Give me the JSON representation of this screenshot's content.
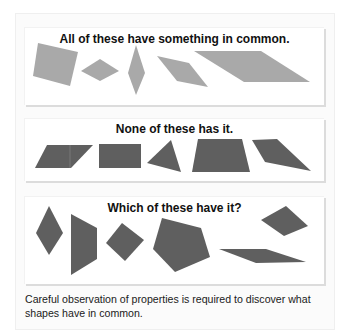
{
  "panels": [
    {
      "title": "All of these have something in common.",
      "fill": "#a9a9a9",
      "shapes": [
        {
          "name": "square",
          "points": "38,43 78,52 70,86 33,76"
        },
        {
          "name": "rhombus",
          "points": "81,71 100,59 119,71 100,81"
        },
        {
          "name": "tall-rhombus",
          "points": "136,45 145,73 136,95 128,73"
        },
        {
          "name": "parallelogram-small",
          "points": "157,56 189,63 208,87 177,81"
        },
        {
          "name": "parallelogram-large",
          "points": "194,51 261,51 310,82 244,82"
        }
      ]
    },
    {
      "title": "None of these has it.",
      "fill": "#5f5f5f",
      "shapes": [
        {
          "name": "parallelogram",
          "points": "47,145 93,145 71,168 35,168"
        },
        {
          "name": "rectangle",
          "points": "99,144 141,144 141,168 99,168"
        },
        {
          "name": "triangle",
          "points": "171,140 181,172 147,163"
        },
        {
          "name": "trapezoid",
          "points": "198,139 242,139 250,172 192,172"
        },
        {
          "name": "quadrilateral",
          "points": "252,140 277,139 311,171 265,162"
        }
      ]
    },
    {
      "title": "Which of these have it?",
      "fill": "#5f5f5f",
      "shapes": [
        {
          "name": "rhombus",
          "points": "49,206 63,233 49,255 36,233"
        },
        {
          "name": "trapezoid",
          "points": "71,214 97,228 97,259 71,275"
        },
        {
          "name": "square",
          "points": "122,223 144,240 125,261 106,243"
        },
        {
          "name": "pentagon",
          "points": "162,218 201,228 210,257 175,272 153,249"
        },
        {
          "name": "rhombus-tilted",
          "points": "286,206 308,226 284,236 261,220"
        },
        {
          "name": "parallelogram-flat",
          "points": "219,249 266,249 306,262 256,263"
        }
      ]
    }
  ],
  "caption": "Careful observation of properties is required to discover what shapes have in common."
}
